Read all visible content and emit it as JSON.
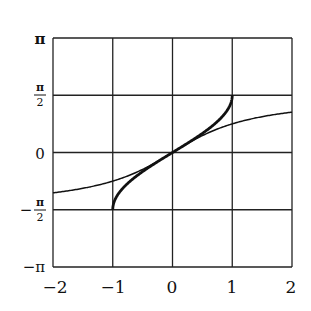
{
  "chart_data": {
    "type": "line",
    "title": "",
    "xlabel": "",
    "ylabel": "",
    "xlim": [
      -2,
      2
    ],
    "ylim": [
      -3.14159,
      3.14159
    ],
    "grid": true,
    "legend": null,
    "x_ticks": [
      -2,
      -1,
      0,
      1,
      2
    ],
    "x_tick_labels": [
      "−2",
      "−1",
      "0",
      "1",
      "2"
    ],
    "y_ticks": [
      -3.14159,
      -1.5708,
      0,
      1.5708,
      3.14159
    ],
    "y_tick_labels": [
      "−π",
      "−π/2",
      "0",
      "π/2",
      "π"
    ],
    "series": [
      {
        "name": "arcsin(x)",
        "style": "thick",
        "x": [
          -1,
          -0.99,
          -0.95,
          -0.9,
          -0.8,
          -0.6,
          -0.4,
          -0.2,
          0,
          0.2,
          0.4,
          0.6,
          0.8,
          0.9,
          0.95,
          0.99,
          1
        ],
        "y": [
          -1.5708,
          -1.4293,
          -1.2532,
          -1.1198,
          -0.9273,
          -0.6435,
          -0.4115,
          -0.2014,
          0,
          0.2014,
          0.4115,
          0.6435,
          0.9273,
          1.1198,
          1.2532,
          1.4293,
          1.5708
        ]
      },
      {
        "name": "arctan(x)",
        "style": "thin",
        "x": [
          -2,
          -1.5,
          -1,
          -0.5,
          0,
          0.5,
          1,
          1.5,
          2
        ],
        "y": [
          -1.1071,
          -0.9828,
          -0.7854,
          -0.4636,
          0,
          0.4636,
          0.7854,
          0.9828,
          1.1071
        ]
      }
    ]
  },
  "labels": {
    "y_pi": "π",
    "y_half_num": "π",
    "y_half_den": "2",
    "y_zero": "0",
    "y_neg_half_sign": "−",
    "y_neg_half_num": "π",
    "y_neg_half_den": "2",
    "y_neg_pi": "−π",
    "x_m2": "−2",
    "x_m1": "−1",
    "x_0": "0",
    "x_1": "1",
    "x_2": "2"
  }
}
